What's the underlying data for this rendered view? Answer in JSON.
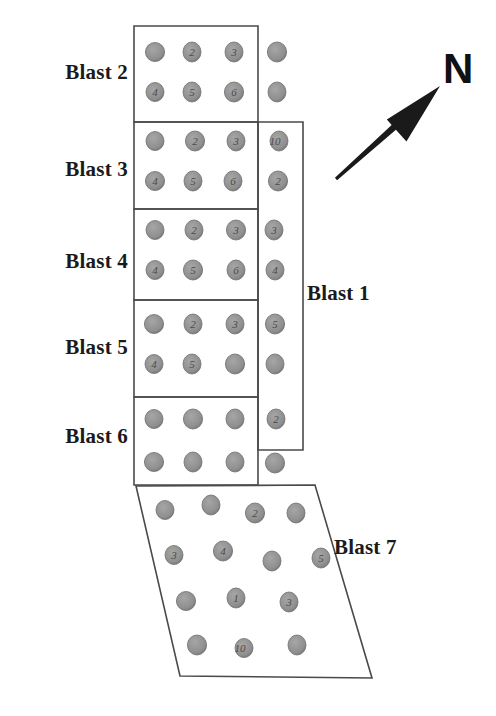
{
  "figure": {
    "kind": "blast-pattern-plan-view",
    "background_color": "#ffffff",
    "outline_color": "#4a4a4a",
    "hole_fill_color": "#8c8c8c",
    "hole_stroke_color": "#6e6e6e",
    "label_color": "#1a1a1a",
    "arrow_color": "#1a1a1a"
  },
  "north_indicator": {
    "label": "N",
    "icon": "north-arrow-icon",
    "tail_x": 336,
    "tail_y": 179,
    "tip_x": 440,
    "tip_y": 86,
    "letter_x": 443,
    "letter_y": 48
  },
  "labels": [
    {
      "id": "blast-2",
      "text": "Blast 2",
      "x": 24,
      "y": 60,
      "align": "right",
      "width": 104
    },
    {
      "id": "blast-3",
      "text": "Blast 3",
      "x": 24,
      "y": 157,
      "align": "right",
      "width": 104
    },
    {
      "id": "blast-4",
      "text": "Blast 4",
      "x": 24,
      "y": 249,
      "align": "right",
      "width": 104
    },
    {
      "id": "blast-5",
      "text": "Blast 5",
      "x": 24,
      "y": 335,
      "align": "right",
      "width": 104
    },
    {
      "id": "blast-6",
      "text": "Blast 6",
      "x": 24,
      "y": 424,
      "align": "right",
      "width": 104
    },
    {
      "id": "blast-1",
      "text": "Blast 1",
      "x": 307,
      "y": 281,
      "align": "left",
      "width": 100
    },
    {
      "id": "blast-7",
      "text": "Blast 7",
      "x": 334,
      "y": 535,
      "align": "left",
      "width": 100
    }
  ],
  "blast_regions": [
    {
      "id": "blast-2",
      "name": "Blast 2",
      "shape": "rect",
      "points": "134,26 258,26 258,122 134,122"
    },
    {
      "id": "blast-3",
      "name": "Blast 3",
      "shape": "rect",
      "points": "134,122 258,122 258,209 134,209"
    },
    {
      "id": "blast-4",
      "name": "Blast 4",
      "shape": "rect",
      "points": "134,209 258,209 258,300 134,300"
    },
    {
      "id": "blast-5",
      "name": "Blast 5",
      "shape": "rect",
      "points": "134,300 258,300 258,397 134,397"
    },
    {
      "id": "blast-6",
      "name": "Blast 6",
      "shape": "rect",
      "points": "134,397 258,397 258,485 134,485"
    },
    {
      "id": "blast-1",
      "name": "Blast 1",
      "shape": "rect",
      "points": "258,122 303,122 303,450 258,450"
    },
    {
      "id": "blast-7",
      "name": "Blast 7",
      "shape": "parallelogram",
      "points": "136,486 315,485 372,678 180,676"
    }
  ],
  "holes": {
    "radius_x": 9,
    "radius_y": 10,
    "items": [
      {
        "x": 155,
        "y": 52,
        "label": "",
        "region": "blast-2"
      },
      {
        "x": 192,
        "y": 52,
        "label": "2",
        "region": "blast-2"
      },
      {
        "x": 234,
        "y": 52,
        "label": "3",
        "region": "blast-2"
      },
      {
        "x": 277,
        "y": 52,
        "label": "",
        "region": "blast-1"
      },
      {
        "x": 155,
        "y": 92,
        "label": "4",
        "region": "blast-2"
      },
      {
        "x": 192,
        "y": 92,
        "label": "5",
        "region": "blast-2"
      },
      {
        "x": 234,
        "y": 92,
        "label": "6",
        "region": "blast-2"
      },
      {
        "x": 277,
        "y": 92,
        "label": "",
        "region": "blast-1"
      },
      {
        "x": 155,
        "y": 141,
        "label": "",
        "region": "blast-3"
      },
      {
        "x": 195,
        "y": 141,
        "label": "2",
        "region": "blast-3"
      },
      {
        "x": 236,
        "y": 141,
        "label": "3",
        "region": "blast-3"
      },
      {
        "x": 279,
        "y": 141,
        "label": "10",
        "region": "blast-1"
      },
      {
        "x": 155,
        "y": 181,
        "label": "4",
        "region": "blast-3"
      },
      {
        "x": 193,
        "y": 181,
        "label": "5",
        "region": "blast-3"
      },
      {
        "x": 233,
        "y": 181,
        "label": "6",
        "region": "blast-3"
      },
      {
        "x": 278,
        "y": 181,
        "label": "2",
        "region": "blast-1"
      },
      {
        "x": 155,
        "y": 230,
        "label": "",
        "region": "blast-4"
      },
      {
        "x": 194,
        "y": 230,
        "label": "2",
        "region": "blast-4"
      },
      {
        "x": 236,
        "y": 230,
        "label": "3",
        "region": "blast-4"
      },
      {
        "x": 274,
        "y": 230,
        "label": "3",
        "region": "blast-1"
      },
      {
        "x": 155,
        "y": 270,
        "label": "4",
        "region": "blast-4"
      },
      {
        "x": 193,
        "y": 270,
        "label": "5",
        "region": "blast-4"
      },
      {
        "x": 236,
        "y": 270,
        "label": "6",
        "region": "blast-4"
      },
      {
        "x": 275,
        "y": 270,
        "label": "4",
        "region": "blast-1"
      },
      {
        "x": 154,
        "y": 324,
        "label": "",
        "region": "blast-5"
      },
      {
        "x": 193,
        "y": 324,
        "label": "2",
        "region": "blast-5"
      },
      {
        "x": 235,
        "y": 324,
        "label": "3",
        "region": "blast-5"
      },
      {
        "x": 275,
        "y": 324,
        "label": "5",
        "region": "blast-1"
      },
      {
        "x": 154,
        "y": 364,
        "label": "4",
        "region": "blast-5"
      },
      {
        "x": 192,
        "y": 364,
        "label": "5",
        "region": "blast-5"
      },
      {
        "x": 235,
        "y": 364,
        "label": "",
        "region": "blast-5"
      },
      {
        "x": 275,
        "y": 364,
        "label": "",
        "region": "blast-1"
      },
      {
        "x": 154,
        "y": 419,
        "label": "",
        "region": "blast-6"
      },
      {
        "x": 193,
        "y": 419,
        "label": "",
        "region": "blast-6"
      },
      {
        "x": 235,
        "y": 419,
        "label": "",
        "region": "blast-6"
      },
      {
        "x": 276,
        "y": 419,
        "label": "2",
        "region": "blast-1"
      },
      {
        "x": 154,
        "y": 462,
        "label": "",
        "region": "blast-6"
      },
      {
        "x": 193,
        "y": 462,
        "label": "",
        "region": "blast-6"
      },
      {
        "x": 235,
        "y": 462,
        "label": "",
        "region": "blast-6"
      },
      {
        "x": 275,
        "y": 463,
        "label": "",
        "region": "outside"
      },
      {
        "x": 165,
        "y": 510,
        "label": "",
        "region": "blast-7"
      },
      {
        "x": 211,
        "y": 505,
        "label": "",
        "region": "blast-7"
      },
      {
        "x": 255,
        "y": 513,
        "label": "2",
        "region": "blast-7"
      },
      {
        "x": 296,
        "y": 513,
        "label": "",
        "region": "blast-7"
      },
      {
        "x": 174,
        "y": 555,
        "label": "3",
        "region": "blast-7"
      },
      {
        "x": 223,
        "y": 551,
        "label": "4",
        "region": "blast-7"
      },
      {
        "x": 272,
        "y": 561,
        "label": "",
        "region": "blast-7"
      },
      {
        "x": 321,
        "y": 558,
        "label": "5",
        "region": "blast-7"
      },
      {
        "x": 186,
        "y": 601,
        "label": "",
        "region": "blast-7"
      },
      {
        "x": 236,
        "y": 598,
        "label": "1",
        "region": "blast-7"
      },
      {
        "x": 289,
        "y": 602,
        "label": "3",
        "region": "blast-7"
      },
      {
        "x": 197,
        "y": 645,
        "label": "",
        "region": "blast-7"
      },
      {
        "x": 244,
        "y": 648,
        "label": "10",
        "region": "blast-7"
      },
      {
        "x": 297,
        "y": 645,
        "label": "",
        "region": "blast-7"
      }
    ]
  }
}
